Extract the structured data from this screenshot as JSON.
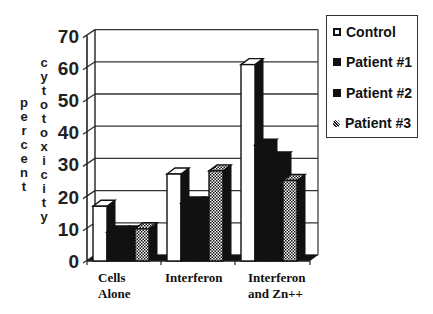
{
  "chart_data": {
    "type": "bar",
    "style": "3d-clustered",
    "title": "",
    "xlabel": "",
    "ylabel": "percent cytotoxicity",
    "ylabel_lines": [
      "percent",
      "cytotoxicity"
    ],
    "ylim": [
      0,
      70
    ],
    "yticks": [
      0,
      10,
      20,
      30,
      40,
      50,
      60,
      70
    ],
    "grid": true,
    "legend_position": "right",
    "categories": [
      "Cells Alone",
      "Interferon",
      "Interferon and Zn++"
    ],
    "category_label_lines": [
      [
        "Cells",
        "Alone"
      ],
      [
        "Interferon"
      ],
      [
        "Interferon",
        "and Zn++"
      ]
    ],
    "series": [
      {
        "name": "Control",
        "pattern": "white",
        "values": [
          17,
          27,
          61
        ]
      },
      {
        "name": "Patient #1",
        "pattern": "black",
        "values": [
          9,
          18,
          36
        ]
      },
      {
        "name": "Patient #2",
        "pattern": "black",
        "values": [
          9,
          18,
          32
        ]
      },
      {
        "name": "Patient #3",
        "pattern": "checkered",
        "values": [
          10,
          28,
          25
        ]
      }
    ]
  },
  "legend": {
    "items": [
      "Control",
      "Patient #1",
      "Patient #2",
      "Patient #3"
    ]
  }
}
